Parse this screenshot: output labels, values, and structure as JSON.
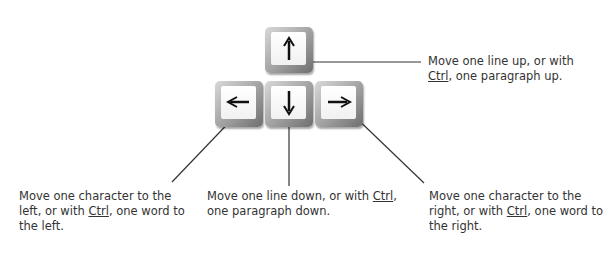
{
  "keys": [
    {
      "id": "up",
      "glyph": "up-arrow"
    },
    {
      "id": "left",
      "glyph": "left-arrow"
    },
    {
      "id": "down",
      "glyph": "down-arrow"
    },
    {
      "id": "right",
      "glyph": "right-arrow"
    }
  ],
  "labels": {
    "up": {
      "pre": "Move one line up, or with ",
      "key": "Ctrl",
      "post": ", one paragraph up."
    },
    "left": {
      "pre": "Move one character to the left, or with ",
      "key": "Ctrl",
      "post": ", one word to the left."
    },
    "down": {
      "pre": "Move one line down, or with ",
      "key": "Ctrl",
      "post": ", one paragraph down."
    },
    "right": {
      "pre": "Move one character to the right, or with ",
      "key": "Ctrl",
      "post": ", one word to the right."
    }
  }
}
